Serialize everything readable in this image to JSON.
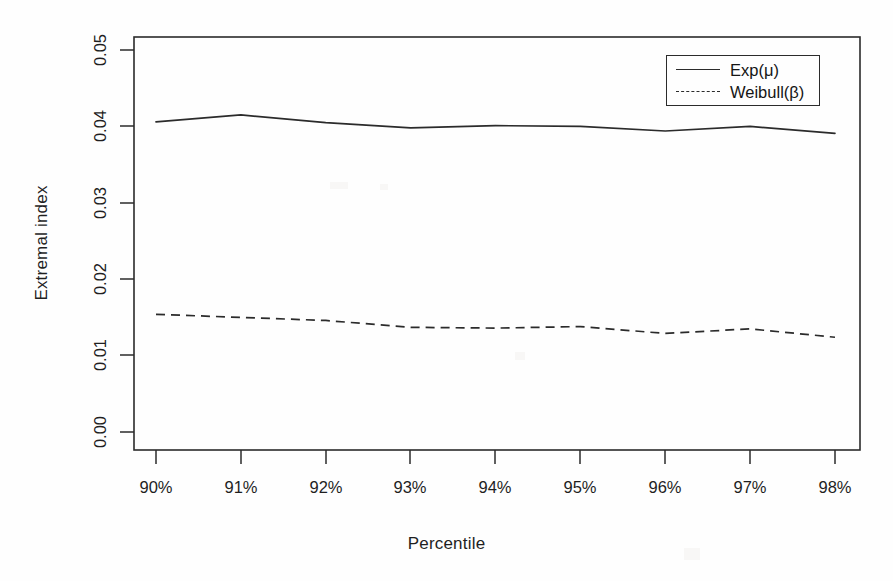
{
  "chart_data": {
    "type": "line",
    "title": "",
    "xlabel": "Percentile",
    "ylabel": "Extremal index",
    "categories": [
      "90%",
      "91%",
      "92%",
      "93%",
      "94%",
      "95%",
      "96%",
      "97%",
      "98%"
    ],
    "x_tick_labels": [
      "90%",
      "91%",
      "92%",
      "93%",
      "94%",
      "95%",
      "96%",
      "97%",
      "98%"
    ],
    "y_tick_labels": [
      "0.00",
      "0.01",
      "0.02",
      "0.03",
      "0.04",
      "0.05"
    ],
    "y_tick_values": [
      0.0,
      0.01,
      0.02,
      0.03,
      0.04,
      0.05
    ],
    "ylim": [
      0.0,
      0.05
    ],
    "xlim": [
      90,
      98
    ],
    "grid": false,
    "legend_position": "top-right",
    "series": [
      {
        "name": "Exp(μ)",
        "style": "solid",
        "color": "#2b2b2b",
        "values": [
          0.0406,
          0.0415,
          0.0405,
          0.0398,
          0.0401,
          0.04,
          0.0394,
          0.04,
          0.0391
        ]
      },
      {
        "name": "Weibull(β)",
        "style": "dashed",
        "color": "#2b2b2b",
        "values": [
          0.0154,
          0.015,
          0.0146,
          0.0137,
          0.0136,
          0.0138,
          0.0129,
          0.0135,
          0.0124
        ]
      }
    ]
  },
  "axes": {
    "x_title": "Percentile",
    "y_title": "Extremal index"
  },
  "legend": {
    "entries": [
      {
        "label": "Exp(μ)",
        "style": "solid"
      },
      {
        "label": "Weibull(β)",
        "style": "dashed"
      }
    ]
  }
}
